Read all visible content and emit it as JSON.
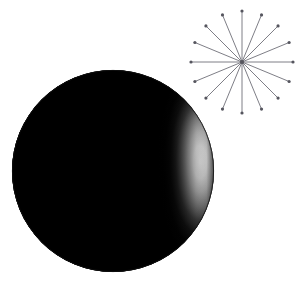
{
  "canvas": {
    "width": 302,
    "height": 289,
    "background_color": "#ffffff",
    "description": "Glossy black sphere with specular highlight beside a sixteen-ray starburst"
  },
  "sphere": {
    "label": "glossy black sphere",
    "center_x": 113,
    "center_y": 171,
    "radius": 101,
    "base_color": "#000000",
    "highlight_color": "#ffffff",
    "edge_color": "#101010",
    "rim_color": "#2a2a2a",
    "highlight_center_x": 200,
    "highlight_center_y": 162,
    "highlight_radius_x": 40,
    "highlight_radius_y": 96,
    "shading": "specular",
    "gradient_stops": [
      {
        "offset": 0,
        "color": "#ffffff"
      },
      {
        "offset": 0.18,
        "color": "#e8e8e8"
      },
      {
        "offset": 0.34,
        "color": "#b4b4b4"
      },
      {
        "offset": 0.5,
        "color": "#6e6e6e"
      },
      {
        "offset": 0.66,
        "color": "#2e2e2e"
      },
      {
        "offset": 0.8,
        "color": "#0c0c0c"
      },
      {
        "offset": 1,
        "color": "#000000"
      }
    ]
  },
  "starburst": {
    "label": "sixteen ray starburst",
    "center_x": 242,
    "center_y": 62,
    "radius": 51,
    "ray_count": 16,
    "ray_color": "#6f6f78",
    "ray_width": 0.9,
    "tip_dot_radius": 1.6,
    "tip_dot_color": "#55555e",
    "hub_dot_radius": 2.0,
    "hub_dot_color": "#55555e",
    "angles_degrees": [
      0,
      22.5,
      45,
      67.5,
      90,
      112.5,
      135,
      157.5,
      180,
      202.5,
      225,
      247.5,
      270,
      292.5,
      315,
      337.5
    ]
  }
}
